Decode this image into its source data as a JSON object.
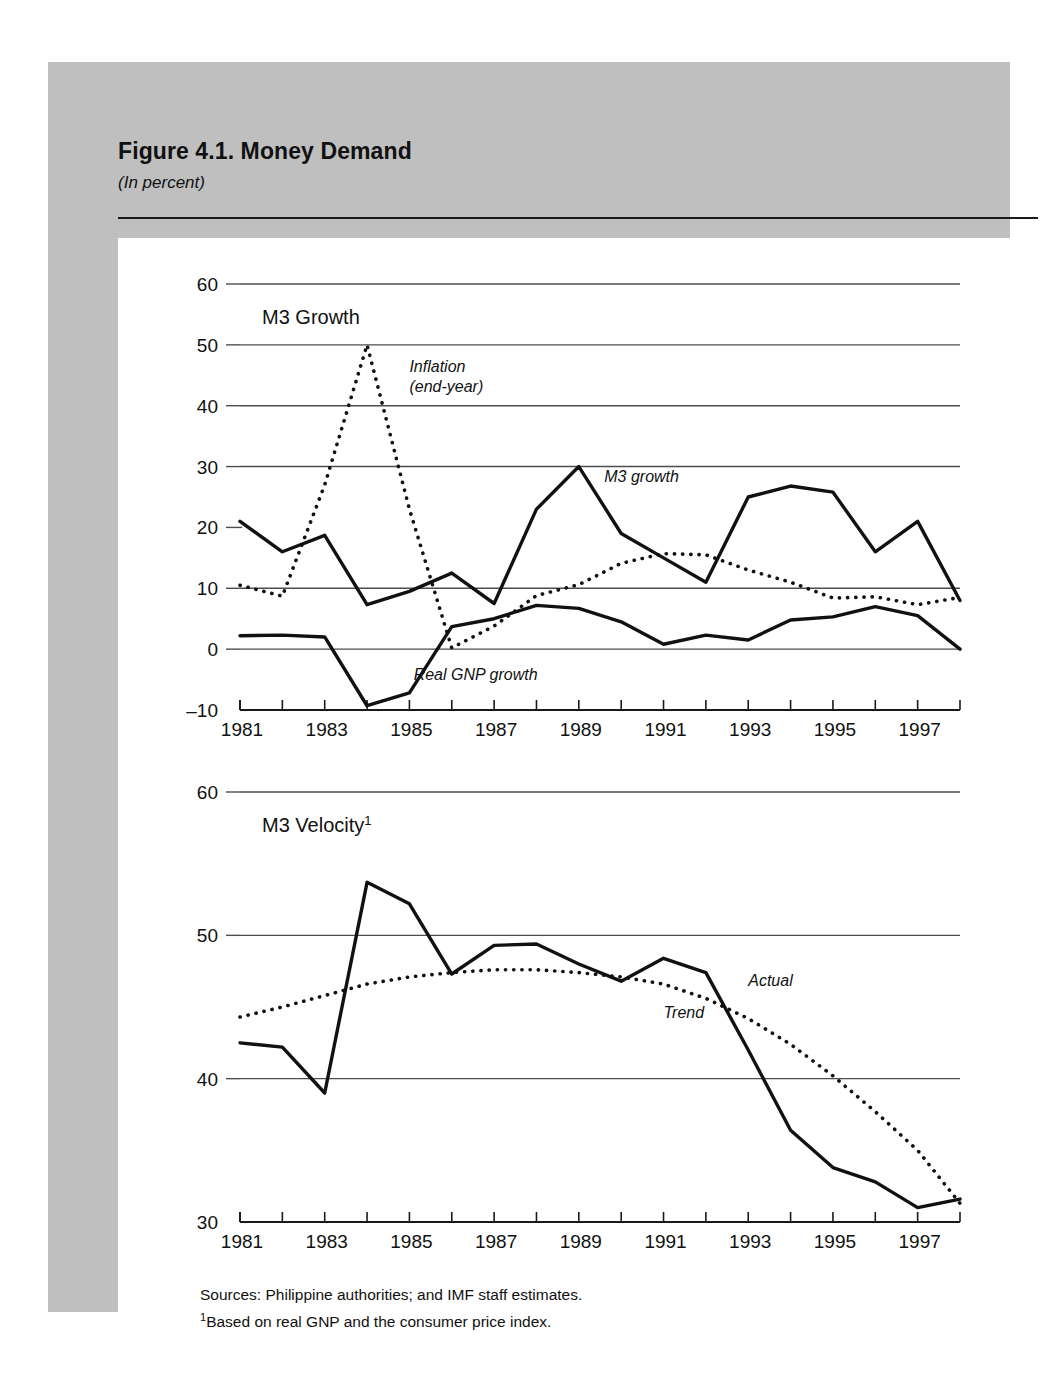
{
  "figure": {
    "title": "Figure 4.1.  Money Demand",
    "subtitle": "(In percent)",
    "sources": "Sources:  Philippine authorities; and IMF staff estimates.",
    "footnote_marker": "1",
    "footnote": "Based on real GNP and the consumer price index."
  },
  "chart_data": [
    {
      "type": "line",
      "title": "M3 Growth",
      "xlabel": "",
      "ylabel": "",
      "ylim": [
        -10,
        60
      ],
      "yticks": [
        -10,
        0,
        10,
        20,
        30,
        40,
        50,
        60
      ],
      "ytick_labels": [
        "–10",
        "0",
        "10",
        "20",
        "30",
        "40",
        "50",
        "60"
      ],
      "gridlines": [
        0,
        10,
        30,
        40,
        50,
        60
      ],
      "grid": true,
      "x": [
        1981,
        1982,
        1983,
        1984,
        1985,
        1986,
        1987,
        1988,
        1989,
        1990,
        1991,
        1992,
        1993,
        1994,
        1995,
        1996,
        1997,
        1998
      ],
      "xtick_labels": [
        "1981",
        "1983",
        "1985",
        "1987",
        "1989",
        "1991",
        "1993",
        "1995",
        "1997"
      ],
      "xtick_label_years": [
        1981,
        1983,
        1985,
        1987,
        1989,
        1991,
        1993,
        1995,
        1997
      ],
      "series": [
        {
          "name": "M3 growth",
          "style": "solid",
          "label": "M3 growth",
          "label_x": 1989.6,
          "label_y": 27.5,
          "values": [
            21.0,
            16.0,
            18.7,
            7.3,
            9.5,
            12.5,
            7.5,
            23.0,
            30.0,
            19.0,
            15.0,
            11.0,
            25.0,
            26.8,
            25.8,
            16.0,
            21.0,
            8.0
          ]
        },
        {
          "name": "Inflation (end-year)",
          "style": "dotted",
          "label": "Inflation\n(end-year)",
          "label_x": 1985.0,
          "label_y": 45.5,
          "values": [
            10.5,
            8.7,
            27.0,
            50.0,
            23.0,
            0.2,
            3.8,
            8.8,
            10.6,
            14.1,
            15.7,
            15.5,
            13.0,
            11.0,
            8.4,
            8.6,
            7.3,
            8.5,
            10.4
          ]
        },
        {
          "name": "Real GNP growth",
          "style": "solid",
          "label": "Real GNP growth",
          "label_x": 1985.1,
          "label_y": -5.0,
          "values": [
            2.2,
            2.3,
            2.0,
            -9.3,
            -7.2,
            3.7,
            5.0,
            7.2,
            6.7,
            4.5,
            0.8,
            2.3,
            1.5,
            4.8,
            5.3,
            7.0,
            5.5,
            0.0
          ]
        }
      ],
      "inflation_x": [
        1981,
        1982,
        1983,
        1984,
        1985,
        1986,
        1987,
        1988,
        1989,
        1990,
        1991,
        1992,
        1993,
        1994,
        1995,
        1996,
        1997,
        1998
      ]
    },
    {
      "type": "line",
      "title": "M3 Velocity",
      "title_superscript": "1",
      "xlabel": "",
      "ylabel": "",
      "ylim": [
        30,
        60
      ],
      "yticks": [
        30,
        40,
        50,
        60
      ],
      "ytick_labels": [
        "30",
        "40",
        "50",
        "60"
      ],
      "gridlines": [
        40,
        50,
        60
      ],
      "grid": true,
      "x": [
        1981,
        1982,
        1983,
        1984,
        1985,
        1986,
        1987,
        1988,
        1989,
        1990,
        1991,
        1992,
        1993,
        1994,
        1995,
        1996,
        1997,
        1998
      ],
      "xtick_labels": [
        "1981",
        "1983",
        "1985",
        "1987",
        "1989",
        "1991",
        "1993",
        "1995",
        "1997"
      ],
      "xtick_label_years": [
        1981,
        1983,
        1985,
        1987,
        1989,
        1991,
        1993,
        1995,
        1997
      ],
      "series": [
        {
          "name": "Actual",
          "style": "solid",
          "label": "Actual",
          "label_x": 1993.0,
          "label_y": 46.5,
          "values": [
            42.5,
            42.2,
            39.0,
            53.7,
            52.2,
            47.3,
            49.3,
            49.4,
            48.0,
            46.8,
            48.4,
            47.4,
            42.0,
            36.4,
            33.8,
            32.8,
            31.0,
            31.6
          ]
        },
        {
          "name": "Trend",
          "style": "dotted",
          "label": "Trend",
          "label_x": 1991.0,
          "label_y": 44.2,
          "values": [
            44.3,
            45.0,
            45.8,
            46.6,
            47.1,
            47.4,
            47.6,
            47.6,
            47.4,
            47.1,
            46.6,
            45.6,
            44.2,
            42.4,
            40.2,
            37.7,
            35.0,
            31.3
          ]
        }
      ]
    }
  ]
}
